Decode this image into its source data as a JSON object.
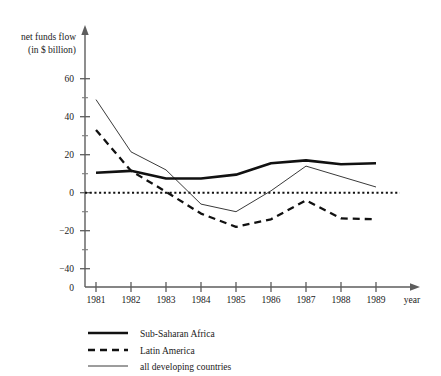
{
  "chart_data": {
    "type": "line",
    "title": "",
    "ylabel_line1": "net funds flow",
    "ylabel_line2": "(in $ billion)",
    "xlabel": "year",
    "grid": false,
    "legend_position": "below-left",
    "categories": [
      "1981",
      "1982",
      "1983",
      "1984",
      "1985",
      "1986",
      "1987",
      "1988",
      "1989"
    ],
    "x_tick_labels": [
      "1981",
      "1982",
      "1983",
      "1984",
      "1985",
      "1986",
      "1987",
      "1988",
      "1989"
    ],
    "y_tick_labels": [
      "60",
      "40",
      "20",
      "0",
      "−20",
      "−40"
    ],
    "y_tick_values": [
      60,
      40,
      20,
      0,
      -20,
      -40
    ],
    "y_minor_tick_values": [
      50,
      30,
      10,
      -10,
      -30
    ],
    "origin_label": "0",
    "ylim": [
      -48,
      68
    ],
    "xlim": [
      "1981",
      "1989"
    ],
    "zero_reference_line": 0,
    "series": [
      {
        "name": "Sub-Saharan Africa",
        "style": "thick-solid",
        "color": "#111111",
        "values": [
          10.5,
          11.5,
          7.5,
          7.5,
          9.5,
          15.5,
          17.0,
          15.0,
          15.5
        ]
      },
      {
        "name": "Latin America",
        "style": "dashed",
        "color": "#111111",
        "values": [
          33.0,
          11.5,
          0.5,
          -11.0,
          -18.0,
          -14.0,
          -4.0,
          -13.5,
          -14.0
        ]
      },
      {
        "name": "all developing countries",
        "style": "thin-solid",
        "color": "#3a3a3a",
        "values": [
          49.0,
          21.5,
          12.0,
          -6.0,
          -10.0,
          1.0,
          14.0,
          8.5,
          3.0
        ]
      }
    ]
  },
  "legend": {
    "items": [
      {
        "label": "Sub-Saharan Africa",
        "style": "thick-solid"
      },
      {
        "label": "Latin America",
        "style": "dashed"
      },
      {
        "label": "all developing countries",
        "style": "thin-solid"
      }
    ]
  }
}
